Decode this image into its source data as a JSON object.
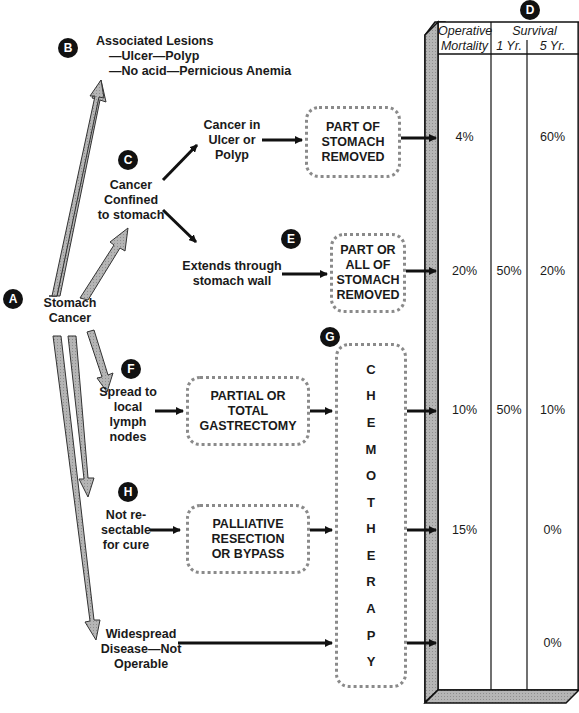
{
  "badges": {
    "a": "A",
    "b": "B",
    "c": "C",
    "d": "D",
    "e": "E",
    "f": "F",
    "g": "G",
    "h": "H"
  },
  "root": {
    "line1": "Stomach",
    "line2": "Cancer"
  },
  "associated": {
    "title": "Associated Lesions",
    "line1": "—Ulcer—Polyp",
    "line2": "—No acid—Pernicious Anemia"
  },
  "confined": {
    "line1": "Cancer",
    "line2": "Confined",
    "line3": "to stomach"
  },
  "ulcer_polyp": {
    "line1": "Cancer in",
    "line2": "Ulcer or",
    "line3": "Polyp"
  },
  "extends": {
    "line1": "Extends through",
    "line2": "stomach wall"
  },
  "spread": {
    "line1": "Spread to",
    "line2": "local",
    "line3": "lymph",
    "line4": "nodes"
  },
  "not_resectable": {
    "line1": "Not re-",
    "line2": "sectable",
    "line3": "for cure"
  },
  "widespread": {
    "line1": "Widespread",
    "line2": "Disease—Not",
    "line3": "Operable"
  },
  "treatments": {
    "part_removed": {
      "line1": "PART OF",
      "line2": "STOMACH",
      "line3": "REMOVED"
    },
    "part_or_all": {
      "line1": "PART OR",
      "line2": "ALL OF",
      "line3": "STOMACH",
      "line4": "REMOVED"
    },
    "gastrectomy": {
      "line1": "PARTIAL OR",
      "line2": "TOTAL",
      "line3": "GASTRECTOMY"
    },
    "palliative": {
      "line1": "PALLIATIVE",
      "line2": "RESECTION",
      "line3": "OR BYPASS"
    },
    "chemotherapy": [
      "C",
      "H",
      "E",
      "M",
      "O",
      "T",
      "H",
      "E",
      "R",
      "A",
      "P",
      "Y"
    ]
  },
  "table": {
    "col1_line1": "Operative",
    "col1_line2": "Mortality",
    "survival": "Survival",
    "col2": "1 Yr.",
    "col3": "5 Yr.",
    "rows": [
      {
        "mortality": "4%",
        "yr1": "",
        "yr5": "60%"
      },
      {
        "mortality": "20%",
        "yr1": "50%",
        "yr5": "20%"
      },
      {
        "mortality": "10%",
        "yr1": "50%",
        "yr5": "10%"
      },
      {
        "mortality": "15%",
        "yr1": "",
        "yr5": "0%"
      },
      {
        "mortality": "",
        "yr1": "",
        "yr5": "0%"
      }
    ]
  },
  "colors": {
    "arrow_gray": "#a8a8a8",
    "ink": "#111111",
    "box_border": "#8a8a8a"
  }
}
